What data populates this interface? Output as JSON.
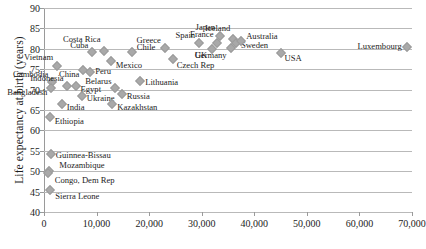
{
  "chart_data": {
    "type": "scatter",
    "title": "",
    "xlabel": "",
    "ylabel": "Life expectancy at birth (years)",
    "xlim": [
      0,
      70000
    ],
    "ylim": [
      40,
      90
    ],
    "xticks": [
      "0",
      "10,000",
      "20,000",
      "30,000",
      "40,000",
      "50,000",
      "60,000",
      "70,000"
    ],
    "xtick_values": [
      0,
      10000,
      20000,
      30000,
      40000,
      50000,
      60000,
      70000
    ],
    "yticks": [
      "40",
      "45",
      "50",
      "55",
      "60",
      "65",
      "70",
      "75",
      "80",
      "85",
      "90"
    ],
    "ytick_values": [
      40,
      45,
      50,
      55,
      60,
      65,
      70,
      75,
      80,
      85,
      90
    ],
    "grid": "horizontal",
    "legend": "none",
    "marker": "diamond",
    "marker_color": "#a9a9a9",
    "points": [
      {
        "name": "Vietnam",
        "x": 2500,
        "y": 75.8,
        "lx": -4,
        "ly": -9,
        "align": "right"
      },
      {
        "name": "Cambodia",
        "x": 1600,
        "y": 71.9,
        "lx": -4,
        "ly": -8,
        "align": "right"
      },
      {
        "name": "Bangladesh",
        "x": 1400,
        "y": 70.3,
        "lx": -4,
        "ly": 4,
        "align": "right"
      },
      {
        "name": "Indonesia",
        "x": 4300,
        "y": 70.8,
        "lx": -3,
        "ly": -8,
        "align": "right"
      },
      {
        "name": "Egypt",
        "x": 6000,
        "y": 70.9,
        "lx": 5,
        "ly": 3,
        "align": "left"
      },
      {
        "name": "India",
        "x": 3400,
        "y": 66.4,
        "lx": 5,
        "ly": 3,
        "align": "left"
      },
      {
        "name": "Ukraine",
        "x": 7200,
        "y": 68.5,
        "lx": 5,
        "ly": 2,
        "align": "left"
      },
      {
        "name": "Belarus",
        "x": 13600,
        "y": 70.3,
        "lx": -4,
        "ly": -7,
        "align": "right"
      },
      {
        "name": "Russia",
        "x": 14800,
        "y": 68.8,
        "lx": 5,
        "ly": 2,
        "align": "left"
      },
      {
        "name": "Kazakhstan",
        "x": 13000,
        "y": 66.4,
        "lx": 5,
        "ly": 3,
        "align": "left"
      },
      {
        "name": "Lithuania",
        "x": 18300,
        "y": 72.1,
        "lx": 5,
        "ly": 1,
        "align": "left"
      },
      {
        "name": "China",
        "x": 7500,
        "y": 74.8,
        "lx": -4,
        "ly": 4,
        "align": "right"
      },
      {
        "name": "Peru",
        "x": 8800,
        "y": 74.2,
        "lx": 5,
        "ly": -1,
        "align": "left"
      },
      {
        "name": "Cuba",
        "x": 9200,
        "y": 79.1,
        "lx": -4,
        "ly": -7,
        "align": "right"
      },
      {
        "name": "Costa Rica",
        "x": 11500,
        "y": 79.4,
        "lx": -4,
        "ly": -12,
        "align": "right"
      },
      {
        "name": "Mexico",
        "x": 12700,
        "y": 76.9,
        "lx": 5,
        "ly": 4,
        "align": "left"
      },
      {
        "name": "Chile",
        "x": 16700,
        "y": 79.3,
        "lx": 5,
        "ly": -5,
        "align": "left"
      },
      {
        "name": "Greece",
        "x": 23000,
        "y": 80.3,
        "lx": -4,
        "ly": -8,
        "align": "right"
      },
      {
        "name": "Czech Rep",
        "x": 24500,
        "y": 77.5,
        "lx": 4,
        "ly": 6,
        "align": "left"
      },
      {
        "name": "Spain",
        "x": 29500,
        "y": 81.4,
        "lx": -4,
        "ly": -8,
        "align": "right"
      },
      {
        "name": "UK",
        "x": 32000,
        "y": 80.0,
        "lx": -5,
        "ly": 6,
        "align": "right"
      },
      {
        "name": "France",
        "x": 33000,
        "y": 81.5,
        "lx": -4,
        "ly": -9,
        "align": "right"
      },
      {
        "name": "Japan",
        "x": 33500,
        "y": 83.1,
        "lx": -5,
        "ly": -9,
        "align": "right"
      },
      {
        "name": "Iceland",
        "x": 36000,
        "y": 82.3,
        "lx": -3,
        "ly": -11,
        "align": "right"
      },
      {
        "name": "Germany",
        "x": 35500,
        "y": 80.3,
        "lx": -4,
        "ly": 7,
        "align": "right"
      },
      {
        "name": "Sweden",
        "x": 36500,
        "y": 81.4,
        "lx": 5,
        "ly": 2,
        "align": "left"
      },
      {
        "name": "Australia",
        "x": 37500,
        "y": 82.0,
        "lx": 5,
        "ly": -5,
        "align": "left"
      },
      {
        "name": "USA",
        "x": 45000,
        "y": 78.9,
        "lx": 4,
        "ly": 5,
        "align": "left"
      },
      {
        "name": "Luxembourg",
        "x": 69000,
        "y": 80.5,
        "lx": -5,
        "ly": -1,
        "align": "right"
      },
      {
        "name": "Ethiopia",
        "x": 1100,
        "y": 63.2,
        "lx": 5,
        "ly": 4,
        "align": "left"
      },
      {
        "name": "Guinnea-Bissau",
        "x": 1300,
        "y": 54.2,
        "lx": 5,
        "ly": 1,
        "align": "left"
      },
      {
        "name": "Mozambique",
        "x": 1000,
        "y": 50.1,
        "lx": 10,
        "ly": -6,
        "align": "left"
      },
      {
        "name": "Congo, Dem Rep",
        "x": 700,
        "y": 49.6,
        "lx": 7,
        "ly": 7,
        "align": "left"
      },
      {
        "name": "Sierra Leone",
        "x": 1200,
        "y": 45.3,
        "lx": 5,
        "ly": 6,
        "align": "left"
      }
    ]
  }
}
